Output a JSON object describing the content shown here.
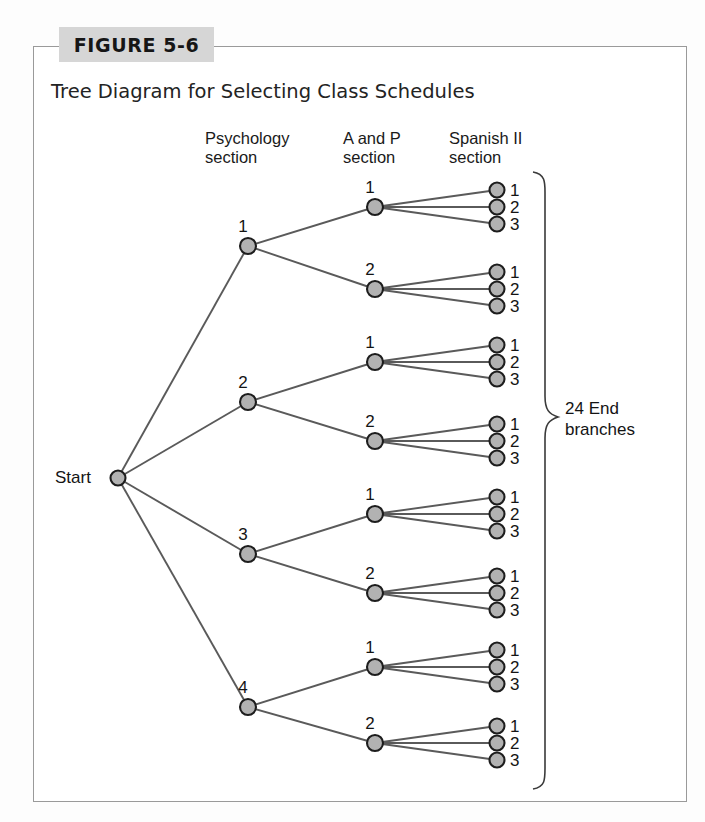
{
  "figure": {
    "tag": "FIGURE 5-6",
    "title": "Tree Diagram for Selecting Class Schedules"
  },
  "columns": {
    "psychology": "Psychology\nsection",
    "anatomy": "A and P\nsection",
    "spanish": "Spanish II\nsection"
  },
  "start": {
    "label": "Start"
  },
  "summary": {
    "brace_label": "24 End\nbranches"
  },
  "colors": {
    "node_fill": "#b2b2b2",
    "node_stroke": "#1d1d1d",
    "edge": "#5a5a5a",
    "frame": "#9a9a9a",
    "tag_background": "#d6d6d6"
  },
  "chart_data": {
    "type": "diagram",
    "subtype": "tree",
    "title": "Tree Diagram for Selecting Class Schedules",
    "levels": [
      "Start",
      "Psychology section",
      "A and P section",
      "Spanish II section"
    ],
    "branching": [
      4,
      2,
      3
    ],
    "total_end_branches": 24,
    "root": {
      "label": "Start",
      "x": 118,
      "y": 478,
      "children": [
        {
          "label": "1",
          "x": 248,
          "y": 246,
          "children": [
            {
              "label": "1",
              "x": 375,
              "y": 207,
              "children": [
                {
                  "label": "1",
                  "x": 497,
                  "y": 190
                },
                {
                  "label": "2",
                  "x": 497,
                  "y": 207
                },
                {
                  "label": "3",
                  "x": 497,
                  "y": 224
                }
              ]
            },
            {
              "label": "2",
              "x": 375,
              "y": 289,
              "children": [
                {
                  "label": "1",
                  "x": 497,
                  "y": 272
                },
                {
                  "label": "2",
                  "x": 497,
                  "y": 289
                },
                {
                  "label": "3",
                  "x": 497,
                  "y": 306
                }
              ]
            }
          ]
        },
        {
          "label": "2",
          "x": 248,
          "y": 402,
          "children": [
            {
              "label": "1",
              "x": 375,
              "y": 362,
              "children": [
                {
                  "label": "1",
                  "x": 497,
                  "y": 345
                },
                {
                  "label": "2",
                  "x": 497,
                  "y": 362
                },
                {
                  "label": "3",
                  "x": 497,
                  "y": 379
                }
              ]
            },
            {
              "label": "2",
              "x": 375,
              "y": 441,
              "children": [
                {
                  "label": "1",
                  "x": 497,
                  "y": 424
                },
                {
                  "label": "2",
                  "x": 497,
                  "y": 441
                },
                {
                  "label": "3",
                  "x": 497,
                  "y": 458
                }
              ]
            }
          ]
        },
        {
          "label": "3",
          "x": 248,
          "y": 554,
          "children": [
            {
              "label": "1",
              "x": 375,
              "y": 514,
              "children": [
                {
                  "label": "1",
                  "x": 497,
                  "y": 497
                },
                {
                  "label": "2",
                  "x": 497,
                  "y": 514
                },
                {
                  "label": "3",
                  "x": 497,
                  "y": 531
                }
              ]
            },
            {
              "label": "2",
              "x": 375,
              "y": 593,
              "children": [
                {
                  "label": "1",
                  "x": 497,
                  "y": 576
                },
                {
                  "label": "2",
                  "x": 497,
                  "y": 593
                },
                {
                  "label": "3",
                  "x": 497,
                  "y": 610
                }
              ]
            }
          ]
        },
        {
          "label": "4",
          "x": 248,
          "y": 707,
          "children": [
            {
              "label": "1",
              "x": 375,
              "y": 667,
              "children": [
                {
                  "label": "1",
                  "x": 497,
                  "y": 650
                },
                {
                  "label": "2",
                  "x": 497,
                  "y": 667
                },
                {
                  "label": "3",
                  "x": 497,
                  "y": 684
                }
              ]
            },
            {
              "label": "2",
              "x": 375,
              "y": 743,
              "children": [
                {
                  "label": "1",
                  "x": 497,
                  "y": 726
                },
                {
                  "label": "2",
                  "x": 497,
                  "y": 743
                },
                {
                  "label": "3",
                  "x": 497,
                  "y": 760
                }
              ]
            }
          ]
        }
      ]
    }
  }
}
